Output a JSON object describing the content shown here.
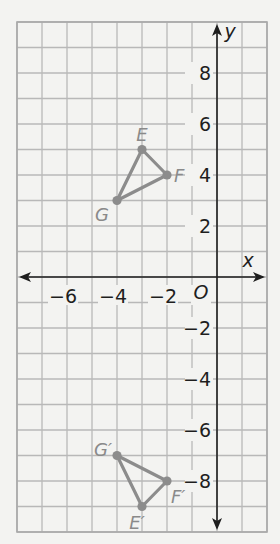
{
  "diagram": {
    "type": "coordinate-plane",
    "x_axis": {
      "label": "x",
      "min": -8,
      "max": 2,
      "tick_labels": [
        {
          "value": -6,
          "text": "−6"
        },
        {
          "value": -4,
          "text": "−4"
        },
        {
          "value": -2,
          "text": "−2"
        }
      ]
    },
    "y_axis": {
      "label": "y",
      "min": -10,
      "max": 10,
      "tick_labels": [
        {
          "value": 8,
          "text": "8"
        },
        {
          "value": 6,
          "text": "6"
        },
        {
          "value": 4,
          "text": "4"
        },
        {
          "value": 2,
          "text": "2"
        },
        {
          "value": -2,
          "text": "−2"
        },
        {
          "value": -4,
          "text": "−4"
        },
        {
          "value": -6,
          "text": "−6"
        },
        {
          "value": -8,
          "text": "−8"
        }
      ]
    },
    "origin_label": "O",
    "grid_step": 1,
    "colors": {
      "background": "#f3f3f1",
      "grid": "#b8b8b8",
      "axis": "#1e1e1e",
      "figure": "#8c8c8c",
      "point_label": "#8a8a8a"
    },
    "figures": [
      {
        "name": "triangle-EFG",
        "points": [
          {
            "label": "E",
            "x": -3,
            "y": 5,
            "label_dx": 0,
            "label_dy": -9,
            "anchor": "middle"
          },
          {
            "label": "F",
            "x": -2,
            "y": 4,
            "label_dx": 7,
            "label_dy": 7,
            "anchor": "start"
          },
          {
            "label": "G",
            "x": -4,
            "y": 3,
            "label_dx": -8,
            "label_dy": 20,
            "anchor": "end"
          }
        ]
      },
      {
        "name": "triangle-E'F'G'",
        "points": [
          {
            "label": "E′",
            "x": -3,
            "y": -9,
            "label_dx": -5,
            "label_dy": 22,
            "anchor": "middle"
          },
          {
            "label": "F′",
            "x": -2,
            "y": -8,
            "label_dx": 4,
            "label_dy": 22,
            "anchor": "start"
          },
          {
            "label": "G′",
            "x": -4,
            "y": -7,
            "label_dx": -5,
            "label_dy": 0,
            "anchor": "end"
          }
        ]
      }
    ]
  }
}
